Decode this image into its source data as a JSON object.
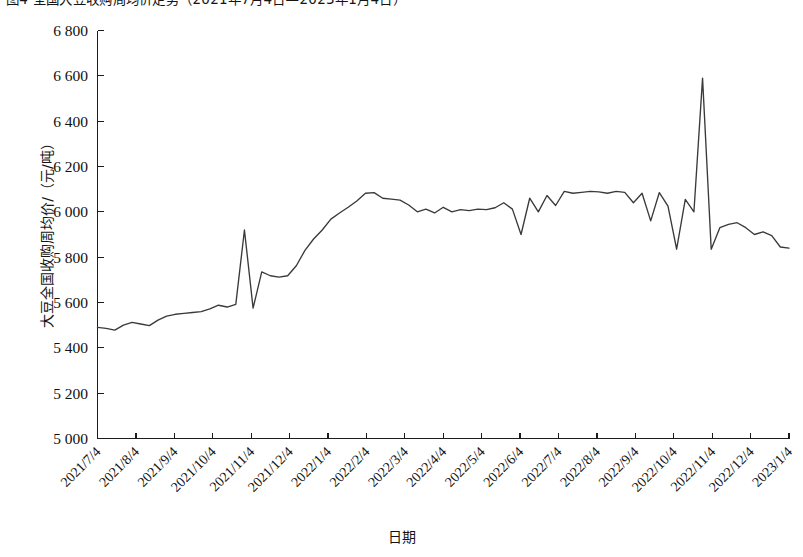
{
  "figure": {
    "clipped_caption": "图4 全国大豆收购周均价走势（2021年7月4日—2023年1月4日）"
  },
  "chart_data": {
    "type": "line",
    "title": "",
    "xlabel": "日期",
    "ylabel": "大豆全国收购周均价/（元/吨）",
    "ylim": [
      5000,
      6800
    ],
    "ytick_step": 200,
    "ytick_labels": [
      "5 000",
      "5 200",
      "5 400",
      "5 600",
      "5 800",
      "6 000",
      "6 200",
      "6 400",
      "6 600",
      "6 800"
    ],
    "ytick_values": [
      5000,
      5200,
      5400,
      5600,
      5800,
      6000,
      6200,
      6400,
      6600,
      6800
    ],
    "xtick_labels": [
      "2021/7/4",
      "2021/8/4",
      "2021/9/4",
      "2021/10/4",
      "2021/11/4",
      "2021/12/4",
      "2022/1/4",
      "2022/2/4",
      "2022/3/4",
      "2022/4/4",
      "2022/5/4",
      "2022/6/4",
      "2022/7/4",
      "2022/8/4",
      "2022/9/4",
      "2022/10/4",
      "2022/11/4",
      "2022/12/4",
      "2023/1/4"
    ],
    "xlim_labels": [
      "2021/7/4",
      "2023/1/4"
    ],
    "grid": false,
    "legend": false,
    "series": [
      {
        "name": "大豆全国收购周均价",
        "unit": "元/吨",
        "color": "#3a3a3a",
        "values": [
          5490,
          5486,
          5478,
          5500,
          5512,
          5505,
          5498,
          5522,
          5540,
          5548,
          5552,
          5556,
          5560,
          5572,
          5588,
          5580,
          5592,
          5920,
          5575,
          5735,
          5718,
          5712,
          5718,
          5762,
          5830,
          5880,
          5920,
          5968,
          5995,
          6020,
          6048,
          6082,
          6085,
          6060,
          6056,
          6052,
          6030,
          6000,
          6012,
          5995,
          6020,
          6000,
          6010,
          6005,
          6012,
          6010,
          6018,
          6040,
          6012,
          5900,
          6060,
          6000,
          6072,
          6028,
          6090,
          6082,
          6086,
          6090,
          6088,
          6082,
          6090,
          6086,
          6040,
          6082,
          5960,
          6085,
          6025,
          5835,
          6055,
          6000,
          6590,
          5835,
          5930,
          5945,
          5952,
          5930,
          5900,
          5912,
          5895,
          5845,
          5840
        ]
      }
    ],
    "annotations": {
      "first_value": 5490,
      "last_value": 5840,
      "max_value": 6590,
      "max_label": "2022/10月中旬峰值",
      "min_value": 5478
    }
  }
}
